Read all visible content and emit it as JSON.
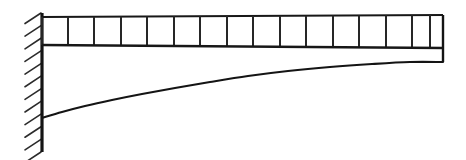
{
  "figure": {
    "caption": "",
    "background_color": "#ffffff",
    "ink_color": "#141414",
    "width": 466,
    "height": 160
  },
  "chart_data": {
    "type": "diagram",
    "xlabel": "",
    "ylabel": "",
    "grid": false,
    "legend": "none",
    "xlim": [
      0,
      466
    ],
    "ylim": [
      0,
      160
    ],
    "elements": [
      {
        "name": "fixed-wall-support",
        "kind": "hatched-boundary",
        "x": 42,
        "y_top": 13,
        "y_bottom": 152,
        "hatch_count": 12,
        "hatch_direction": "lower-left-to-upper-right",
        "hatch_length": 17,
        "hatch_spacing": 11.5
      },
      {
        "name": "support-vertical-line",
        "kind": "line",
        "x1": 42,
        "y1": 13,
        "x2": 42,
        "y2": 152
      },
      {
        "name": "beam-axis-line",
        "kind": "line",
        "x1": 42,
        "y1": 45,
        "x2": 443,
        "y2": 48
      },
      {
        "name": "distributed-load-top-line",
        "kind": "line",
        "x1": 42,
        "y1": 17,
        "x2": 443,
        "y2": 15
      },
      {
        "name": "distributed-load-cells",
        "kind": "uniform-load-boxes",
        "count": 15,
        "x_start": 42,
        "x_end": 443,
        "divider_x": [
          68,
          94,
          121,
          147,
          174,
          200,
          227,
          253,
          280,
          306,
          333,
          359,
          386,
          412,
          430
        ],
        "y_top_start": 17,
        "y_top_end": 15,
        "y_bottom_start": 45,
        "y_bottom_end": 48
      },
      {
        "name": "beam-free-end-drop",
        "kind": "line",
        "x1": 443,
        "y1": 15,
        "x2": 443,
        "y2": 62
      },
      {
        "name": "deflection-curve",
        "kind": "curve",
        "description": "Deflected shape of cantilever, fixed end at wall deflects downward, curve rises toward free end",
        "start": [
          42,
          118
        ],
        "end": [
          443,
          62
        ],
        "points": [
          [
            42,
            118
          ],
          [
            62,
            112
          ],
          [
            85,
            106
          ],
          [
            112,
            100
          ],
          [
            142,
            94
          ],
          [
            175,
            88
          ],
          [
            210,
            82
          ],
          [
            248,
            76
          ],
          [
            288,
            71
          ],
          [
            330,
            67
          ],
          [
            372,
            64
          ],
          [
            410,
            62
          ],
          [
            443,
            62
          ]
        ]
      }
    ]
  }
}
